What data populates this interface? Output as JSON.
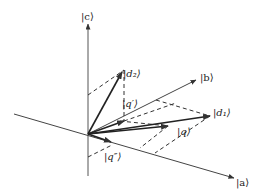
{
  "diagram": {
    "title": "",
    "axes": {
      "a": {
        "label": "|a⟩"
      },
      "b": {
        "label": "|b⟩"
      },
      "c": {
        "label": "|c⟩"
      }
    },
    "vectors": {
      "d1": {
        "label": "|d₁⟩"
      },
      "d2": {
        "label": "|d₂⟩"
      },
      "q": {
        "label": "|q⟩"
      },
      "q_prime": {
        "label": "|q′⟩"
      },
      "q_double_prime": {
        "label": "|q″⟩"
      }
    },
    "colors": {
      "line": "#333333",
      "background": "#ffffff"
    }
  }
}
